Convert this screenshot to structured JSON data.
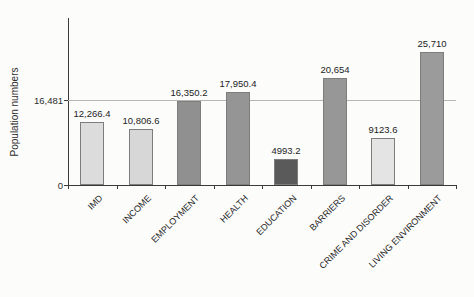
{
  "chart_data": {
    "type": "bar",
    "title": "",
    "xlabel": "",
    "ylabel": "Population numbers",
    "categories": [
      "IMD",
      "INCOME",
      "EMPLOYMENT",
      "HEALTH",
      "EDUCATION",
      "BARRIERS",
      "CRIME AND DISORDER",
      "LIVING ENVIRONMENT"
    ],
    "values": [
      12266.4,
      10806.6,
      16350.2,
      17950.4,
      4993.2,
      20654,
      9123.6,
      25710
    ],
    "value_labels": [
      "12,266.4",
      "10,806.6",
      "16,350.2",
      "17,950.4",
      "4993.2",
      "20,654",
      "9123.6",
      "25,710"
    ],
    "bar_colors": [
      "#dcdcdc",
      "#d7d7d7",
      "#909090",
      "#959595",
      "#5a5a5a",
      "#979797",
      "#e4e4e4",
      "#9b9b9b"
    ],
    "bar_border_color": "#7d7d7d",
    "reference_line": {
      "value": 16481,
      "label": "16,481",
      "color": "#b6b6b4"
    },
    "y_axis": {
      "zero_label": "0",
      "ylim": [
        0,
        32500
      ],
      "labeled_ticks": [
        "0",
        "16,481"
      ]
    },
    "grid": "off",
    "legend": "none"
  }
}
